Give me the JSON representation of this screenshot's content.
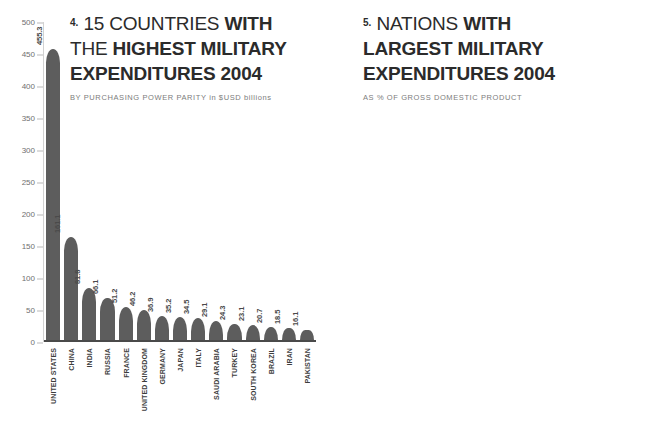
{
  "chart_data": [
    {
      "id": "left",
      "type": "bar",
      "index_label": "4.",
      "title_lines": [
        {
          "prefix": "4.",
          "light": "15 COUNTRIES",
          "strong": " WITH"
        },
        {
          "prefix": "",
          "light": "THE ",
          "strong": "HIGHEST MILITARY"
        },
        {
          "prefix": "",
          "light": "",
          "strong": "EXPENDITURES 2004"
        }
      ],
      "title": "15 COUNTRIES WITH THE HIGHEST MILITARY EXPENDITURES 2004",
      "subtitle": "BY PURCHASING POWER PARITY in $USD billions",
      "xlabel": "",
      "ylabel": "$USD billions",
      "ylim": [
        0,
        500
      ],
      "ytick_values": [
        500,
        450,
        400,
        350,
        300,
        250,
        200,
        150,
        100,
        50,
        0
      ],
      "ytick_labels": [
        "500",
        "450",
        "400",
        "350",
        "300",
        "250",
        "200",
        "150",
        "100",
        "50",
        "0"
      ],
      "grid": false,
      "bar_color": "#5d5d5d",
      "categories": [
        "UNITED STATES",
        "CHINA",
        "INDIA",
        "RUSSIA",
        "FRANCE",
        "UNITED KINGDOM",
        "GERMANY",
        "JAPAN",
        "ITALY",
        "SAUDI ARABIA",
        "TURKEY",
        "SOUTH KOREA",
        "BRAZIL",
        "IRAN",
        "PAKISTAN"
      ],
      "values": [
        455.3,
        161.1,
        81.8,
        66.1,
        51.2,
        46.2,
        36.9,
        35.2,
        34.5,
        29.1,
        24.3,
        23.1,
        20.7,
        18.5,
        16.1
      ],
      "value_labels": [
        "455.3",
        "161.1",
        "81.8",
        "66.1",
        "51.2",
        "46.2",
        "36.9",
        "35.2",
        "34.5",
        "29.1",
        "24.3",
        "23.1",
        "20.7",
        "18.5",
        "16.1"
      ]
    },
    {
      "id": "right",
      "type": "bar",
      "index_label": "5.",
      "title_lines": [
        {
          "prefix": "5.",
          "light": "NATIONS",
          "strong": " WITH"
        },
        {
          "prefix": "",
          "light": "",
          "strong": "LARGEST MILITARY"
        },
        {
          "prefix": "",
          "light": "",
          "strong": "EXPENDITURES 2004"
        }
      ],
      "title": "NATIONS WITH LARGEST MILITARY EXPENDITURES 2004",
      "subtitle": "AS % OF GROSS DOMESTIC PRODUCT",
      "xlabel": "",
      "ylabel": "% of GDP",
      "ylim": [
        0,
        16
      ],
      "ytick_values": [
        16.0,
        14.0,
        12.0,
        10.0,
        8.0,
        6.0,
        4.0,
        2.0,
        0.0
      ],
      "ytick_labels": [
        "16.0",
        "14.0",
        "12.0",
        "10.0",
        "8.0",
        "6.0",
        "4.0",
        "2.0",
        "0.0"
      ],
      "grid": false,
      "bar_color": "#b6b6b6",
      "categories": [
        "JORDAN",
        "ERITREA",
        "OMAN",
        "ANGOLA",
        "QATAR",
        "SAUDI ARABIA",
        "ISRAEL",
        "YEMEN",
        "ARMENIA",
        "BAHRAIN",
        "BURUNDI",
        "MACEDONIA",
        "SYRIA",
        "MALDIVES",
        "KUWAIT",
        "TURKEY",
        "BRUNEI",
        "MOROCCO",
        "PAKISTAN",
        "SINGAPORE"
      ],
      "values": [
        14.6,
        13.4,
        11.4,
        10.6,
        10.0,
        10.0,
        8.2,
        7.0,
        6.5,
        6.3,
        6.0,
        6.0,
        5.6,
        5.5,
        5.3,
        5.3,
        5.1,
        5.0,
        4.6,
        4.5
      ],
      "value_labels": [
        "14.6 %",
        "13.4 %",
        "11.4 %",
        "10.6 %",
        "10.0 %",
        "10.0 %",
        "8.2 %",
        "7.0 %",
        "6.5 %",
        "6.3 %",
        "6.0 %",
        "6.0 %",
        "5.6 %",
        "5.5 %",
        "5.3 %",
        "5.3 %",
        "5.1 %",
        "5.0 %",
        "4.6 %",
        "4.5 %"
      ]
    }
  ],
  "colors": {
    "background": "#ffffff",
    "bar_dark": "#5d5d5d",
    "bar_light": "#b6b6b6",
    "title_text": "#2b2b2b",
    "subtitle_text": "#7d7d7d",
    "axis_text": "#6f6f6f",
    "category_text_left": "#3d3d3d",
    "category_text_right": "#6b6b6b",
    "inbar_label": "#ffffff"
  }
}
